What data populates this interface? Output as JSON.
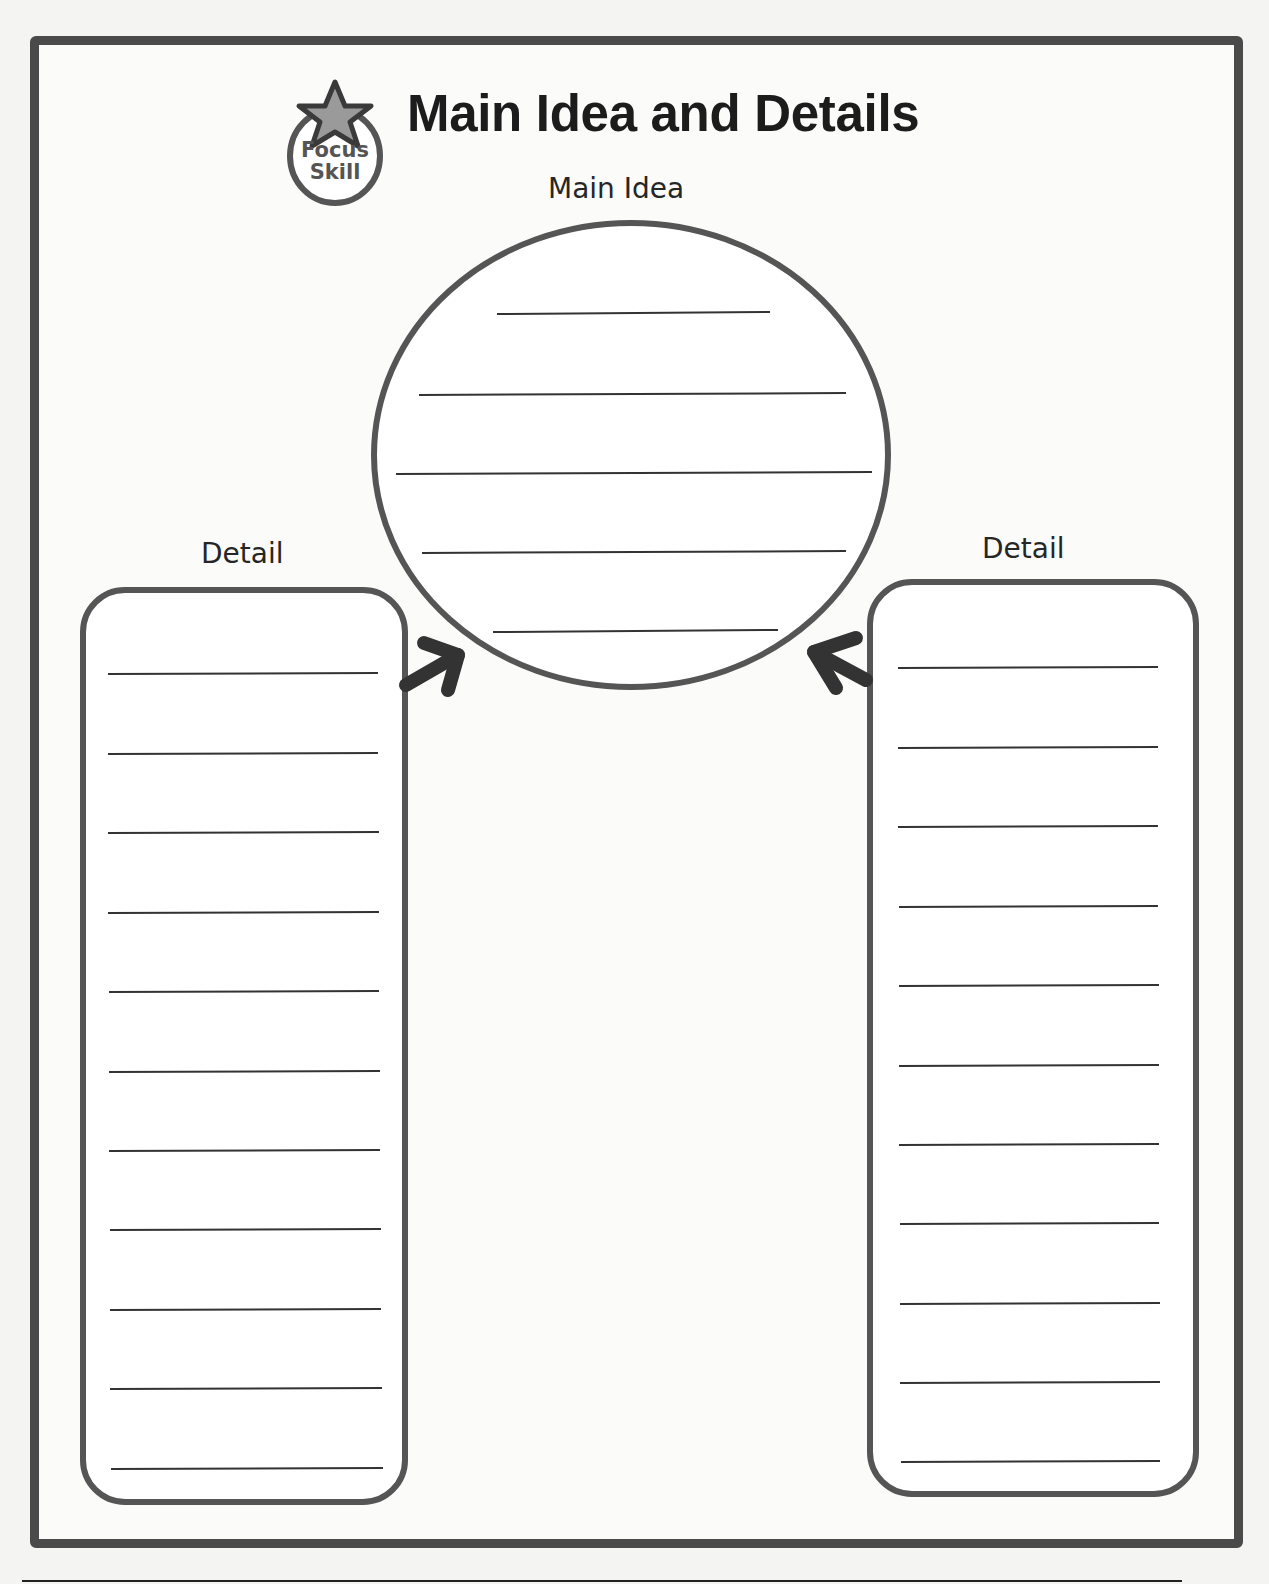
{
  "header": {
    "title": "Main Idea and Details",
    "badge": {
      "line1": "Focus",
      "line2": "Skill",
      "icon": "star-icon"
    }
  },
  "organizer": {
    "main_idea": {
      "label": "Main Idea",
      "shape": "circle",
      "blank_lines": 5
    },
    "details": [
      {
        "label": "Detail",
        "position": "left",
        "blank_lines": 11
      },
      {
        "label": "Detail",
        "position": "right",
        "blank_lines": 11
      }
    ],
    "arrows": [
      {
        "from": "left-detail",
        "to": "main-idea",
        "icon": "arrow-up-right-icon"
      },
      {
        "from": "right-detail",
        "to": "main-idea",
        "icon": "arrow-up-left-icon"
      }
    ]
  },
  "colors": {
    "ink": "#1c1c1c",
    "stroke": "#555555",
    "arrow": "#333333",
    "star_fill": "#9a9a9a",
    "paper": "#fbfbfa"
  }
}
